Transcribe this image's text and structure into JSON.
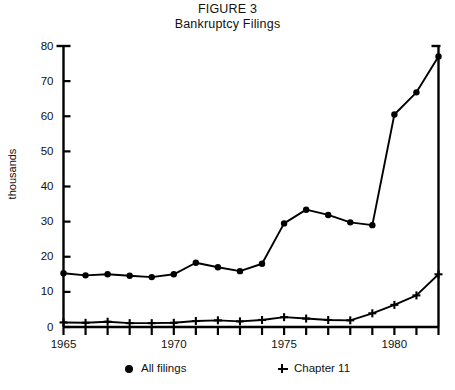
{
  "figure": {
    "title_line1": "FIGURE 3",
    "title_line2": "Bankruptcy Filings"
  },
  "legend": {
    "items": [
      {
        "label": "All filings",
        "marker": "circle-marker"
      },
      {
        "label": "Chapter 11",
        "marker": "plus-marker"
      }
    ]
  },
  "axes": {
    "ylabel": "thousands",
    "yticks": [
      "0",
      "10",
      "20",
      "30",
      "40",
      "50",
      "60",
      "70",
      "80"
    ],
    "xticks": [
      "1965",
      "1970",
      "1975",
      "1980"
    ]
  },
  "chart_data": {
    "type": "line",
    "xlabel": "",
    "ylabel": "thousands",
    "xlim": [
      1965,
      1982
    ],
    "ylim": [
      0,
      80
    ],
    "grid": false,
    "legend_position": "bottom",
    "x": [
      1965,
      1966,
      1967,
      1968,
      1969,
      1970,
      1971,
      1972,
      1973,
      1974,
      1975,
      1976,
      1977,
      1978,
      1979,
      1980,
      1981,
      1982
    ],
    "series": [
      {
        "name": "All filings",
        "marker": "circle",
        "values": [
          15.3,
          14.7,
          15.0,
          14.6,
          14.2,
          15.0,
          18.3,
          17.0,
          15.9,
          18.0,
          29.5,
          33.4,
          31.9,
          29.8,
          29.0,
          60.5,
          66.8,
          77.0
        ]
      },
      {
        "name": "Chapter 11",
        "marker": "plus",
        "values": [
          1.3,
          1.2,
          1.5,
          1.1,
          1.1,
          1.2,
          1.7,
          1.9,
          1.6,
          2.0,
          2.8,
          2.4,
          2.0,
          1.9,
          3.9,
          6.3,
          9.0,
          15.0
        ]
      }
    ]
  }
}
